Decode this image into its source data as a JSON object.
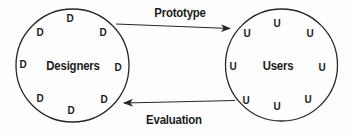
{
  "diagram": {
    "groups": {
      "designers": {
        "label": "Designers",
        "member_symbol": "D",
        "members": [
          "D",
          "D",
          "D",
          "D",
          "D",
          "D",
          "D",
          "D"
        ]
      },
      "users": {
        "label": "Users",
        "member_symbol": "U",
        "members": [
          "U",
          "U",
          "U",
          "U",
          "U",
          "U",
          "U",
          "U"
        ]
      }
    },
    "arrows": {
      "prototype": {
        "label": "Prototype",
        "direction": "designers-to-users"
      },
      "evaluation": {
        "label": "Evaluation",
        "direction": "users-to-designers"
      }
    },
    "colors": {
      "background": "#fefefe",
      "line": "#262626",
      "text": "#1b1b1b"
    }
  }
}
